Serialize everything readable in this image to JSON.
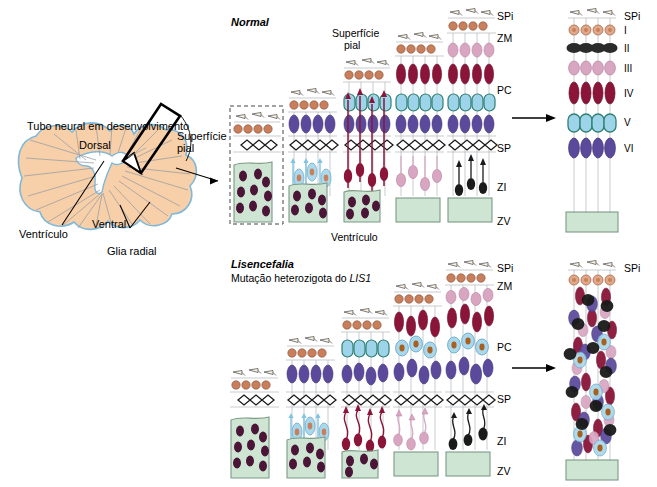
{
  "figure": {
    "anatomy": {
      "title": "Tubo neural em desenvolvimento",
      "dorsal": "Dorsal",
      "ventral": "Ventral",
      "ventricle": "Ventrículo",
      "radial_glia": "Glia radial",
      "pial_surface": "Superfície\npial",
      "pial_surface_line1": "Superfície",
      "pial_surface_line2": "pial"
    },
    "rows": [
      {
        "id": "normal",
        "title": "Normal",
        "subtitle": "",
        "pial_label_line1": "Superfície",
        "pial_label_line2": "pial",
        "ventricle_label": "Ventrículo"
      },
      {
        "id": "lissencephaly",
        "title": "Lisencefalia",
        "subtitle_pre": "Mutação heterozigota do ",
        "subtitle_gene": "LIS1",
        "subtitle": "Mutação heterozigota do LIS1"
      }
    ],
    "zone_labels": {
      "spi": "SPi",
      "zm": "ZM",
      "pc": "PC",
      "sp": "SP",
      "zi": "ZI",
      "zv": "ZV"
    },
    "cortical_layers": [
      "I",
      "II",
      "III",
      "IV",
      "V",
      "VI"
    ],
    "result_top_label": "SPi",
    "colors": {
      "tube_fill": "#f7cfa8",
      "tube_outline": "#7fb8d8",
      "glia_line": "#9aa0a6",
      "vz_fill": "#cfe5d4",
      "vz_outline": "#7d9a85",
      "vz_cell": "#4a1536",
      "layer1": "#c8805c",
      "layer2": "#2b2b2b",
      "layer3": "#d9a6c2",
      "layer4": "#8b1538",
      "layer5": "#9ed4ea",
      "layer5_outline": "#2f7f72",
      "layer6": "#5b4a9c",
      "sp_diamond": "#ffffff",
      "sp_outline": "#1a1a1a",
      "fiber": "#b9bec3"
    }
  }
}
